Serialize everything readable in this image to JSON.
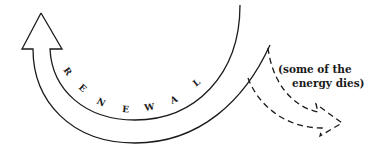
{
  "diagram": {
    "main_arrow": {
      "label_letters": [
        "R",
        "E",
        "N",
        "E",
        "W",
        "A",
        "L"
      ],
      "label": "RENEWAL",
      "direction": "up-left (curving back)",
      "stroke": "#1a1a1a"
    },
    "branch_arrow": {
      "style": "dashed",
      "direction": "down-right",
      "stroke": "#1a1a1a"
    },
    "annotation": {
      "line1": "(some of the",
      "line2": "energy dies)"
    }
  }
}
